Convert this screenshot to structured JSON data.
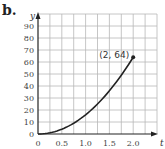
{
  "panel_label": "b.",
  "chart_data": {
    "type": "line",
    "title": "",
    "xlabel": "t",
    "ylabel": "y",
    "xlim": [
      0,
      2.5
    ],
    "ylim": [
      0,
      100
    ],
    "x_ticks": [
      "0",
      "0.5",
      "1.0",
      "1.5",
      "2.0"
    ],
    "y_ticks": [
      "0",
      "10",
      "20",
      "30",
      "40",
      "50",
      "60",
      "70",
      "80",
      "90"
    ],
    "grid": true,
    "grid_x_step": 0.25,
    "grid_y_step": 10,
    "series": [
      {
        "name": "y = 16t^2",
        "x": [
          0,
          0.25,
          0.5,
          0.75,
          1.0,
          1.25,
          1.5,
          1.75,
          2.0
        ],
        "values": [
          0,
          1,
          4,
          9,
          16,
          25,
          36,
          49,
          64
        ]
      }
    ],
    "annotations": [
      {
        "text": "(2, 64)",
        "x": 2,
        "y": 64,
        "marker": "point"
      }
    ]
  },
  "colors": {
    "curve": "#222222",
    "grid": "#b8b8b8",
    "axis": "#222222"
  }
}
